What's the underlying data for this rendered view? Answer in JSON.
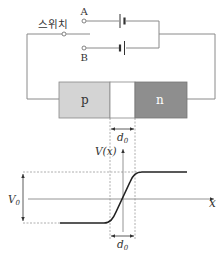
{
  "circuit": {
    "switch_label": "스위치",
    "terminal_a_label": "A",
    "terminal_b_label": "B",
    "p_region_label": "p",
    "n_region_label": "n",
    "depletion_width_label": "d",
    "depletion_width_subscript": "0"
  },
  "graph": {
    "y_axis_label": "V(x)",
    "x_axis_label": "x",
    "potential_label": "V",
    "potential_subscript": "0",
    "width_label": "d",
    "width_subscript": "0"
  },
  "colors": {
    "p_region": "#d4d4d4",
    "n_region": "#8e8e8e",
    "depletion": "#ffffff",
    "wire": "#8a8a8a",
    "curve": "#222222"
  }
}
